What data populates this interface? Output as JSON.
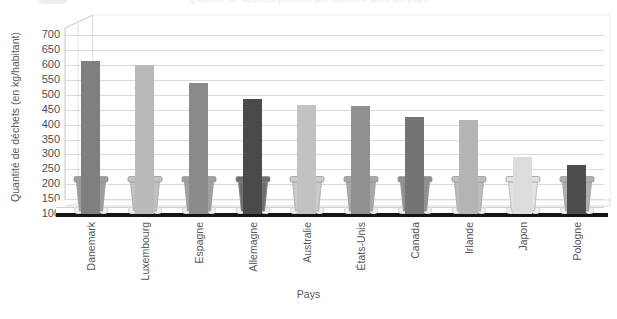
{
  "figure": {
    "clipped_header": "Quantité de déchets produits par habitant dans dix pays",
    "ylabel": "Quantité de déchets (en kg/habitant)",
    "xlabel": "Pays"
  },
  "chart_data": {
    "type": "bar",
    "title": "Quantité de déchets produits par habitant dans dix pays",
    "xlabel": "Pays",
    "ylabel": "Quantité de déchets (en kg/habitant)",
    "ylim": [
      100,
      725
    ],
    "yticks": [
      700,
      650,
      600,
      550,
      500,
      450,
      400,
      350,
      300,
      250,
      200,
      150,
      100
    ],
    "grid": true,
    "legend": "none",
    "categories": [
      "Danemark",
      "Luxembourg",
      "Espagne",
      "Allemagne",
      "Australie",
      "États-Unis",
      "Canada",
      "Irlande",
      "Japon",
      "Pologne"
    ],
    "values": [
      615,
      600,
      540,
      485,
      465,
      462,
      425,
      415,
      290,
      265
    ],
    "bar_colors": [
      "#7f7f82",
      "#b9b9bc",
      "#8a8a8d",
      "#4a4a4d",
      "#c2c2c5",
      "#909093",
      "#747477",
      "#b4b4b7",
      "#dcdcdd",
      "#4d4d50"
    ],
    "bin_colors": [
      "#9c9c9f",
      "#c2c2c4",
      "#a0a0a3",
      "#6d6d70",
      "#cbcbcd",
      "#a8a8ab",
      "#8f8f92",
      "#bdbdc0",
      "#e2e2e3",
      "#aeaeb1"
    ]
  }
}
